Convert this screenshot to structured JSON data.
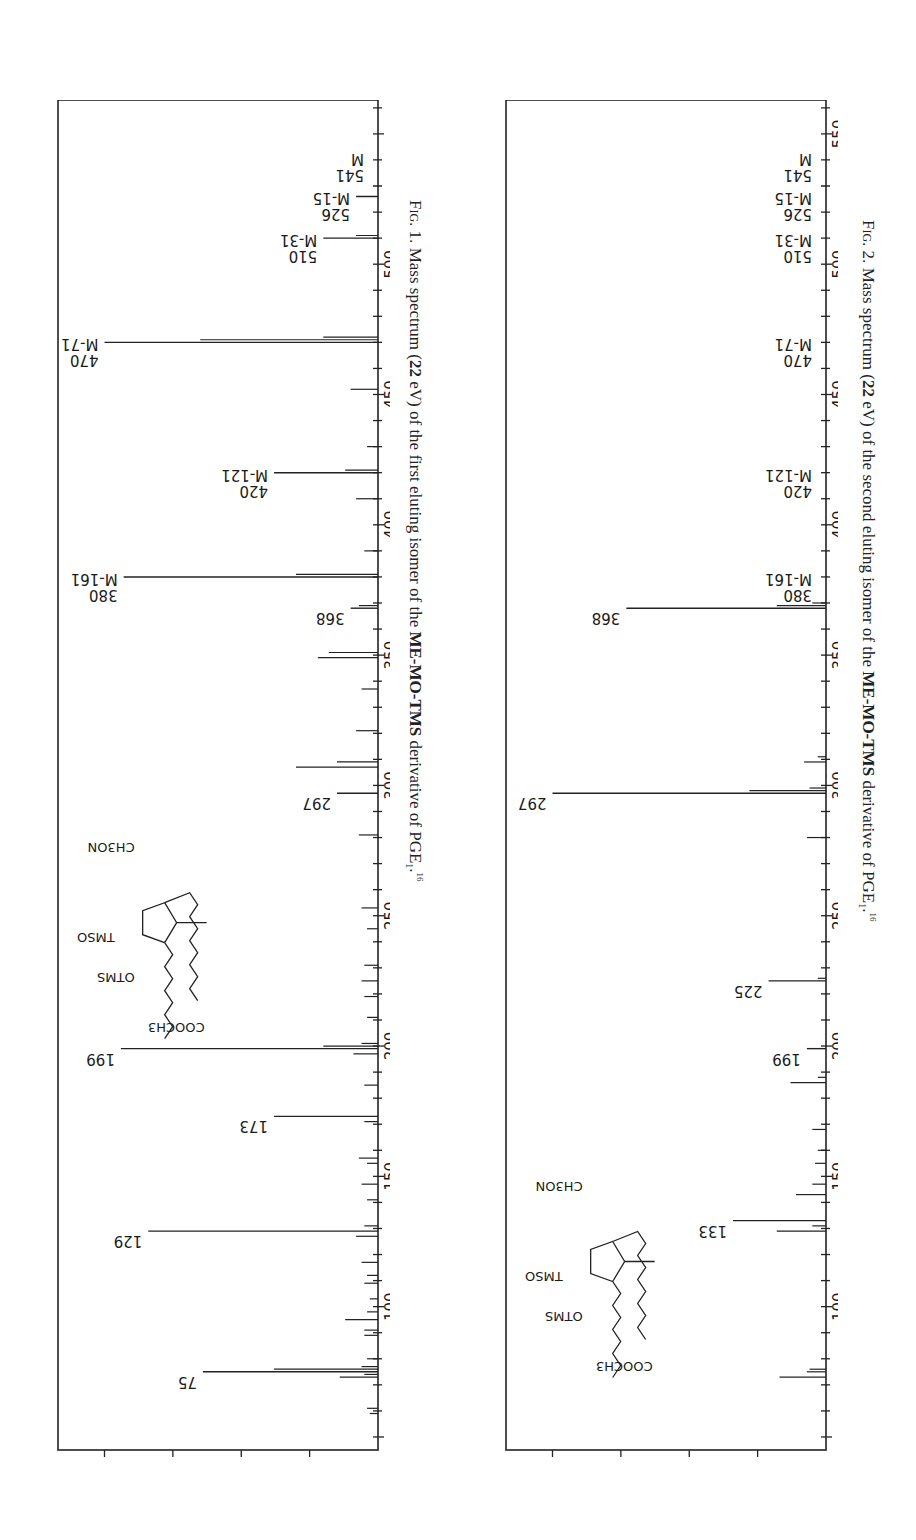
{
  "figures": [
    {
      "id": "fig1",
      "caption": {
        "fig_label": "Fig. 1.",
        "text_before": "Mass spectrum (",
        "energy": "22",
        "text_mid": " eV) of the first eluting isomer of the ",
        "derivative": "ME-MO-TMS",
        "text_after": " derivative of PGE",
        "subscript": "1",
        "period": ".",
        "ref": "16"
      }
    },
    {
      "id": "fig2",
      "caption": {
        "fig_label": "Fig. 2.",
        "text_before": "Mass spectrum (",
        "energy": "22",
        "text_mid": " eV) of the second eluting isomer of the ",
        "derivative": "ME-MO-TMS",
        "text_after": " derivative of PGE",
        "subscript": "1",
        "period": ".",
        "ref": "16"
      }
    }
  ],
  "structure_labels": {
    "top_chain": "COOCH3",
    "oxime": "CH3ON",
    "tmso": "TMSO",
    "otms": "OTMS",
    "h": "H"
  },
  "chart_data": [
    {
      "type": "bar",
      "title": "Fig. 1. Mass spectrum (22 eV) of the first eluting isomer of the ME-MO-TMS derivative of PGE1",
      "xlabel": "m/e",
      "ylabel": "RELATIVE INTENSITY",
      "xlim": [
        45,
        563
      ],
      "ylim": [
        0,
        117
      ],
      "x_ticks": [
        100,
        150,
        200,
        250,
        300,
        350,
        400,
        450,
        500
      ],
      "y_ticks": [
        25,
        50,
        75,
        100
      ],
      "secondary_axis": {
        "label": "Σ%",
        "ticks": [
          "8.4",
          "4"
        ]
      },
      "grid": false,
      "orientation": "rotated 90deg clockwise",
      "labeled_peaks": [
        {
          "mz": 75,
          "label": "75",
          "intensity": 64
        },
        {
          "mz": 129,
          "label": "129",
          "intensity": 84
        },
        {
          "mz": 173,
          "label": "173",
          "intensity": 38
        },
        {
          "mz": 199,
          "label": "199",
          "intensity": 94
        },
        {
          "mz": 297,
          "label": "297",
          "intensity": 15
        },
        {
          "mz": 368,
          "label": "368",
          "intensity": 10
        },
        {
          "mz": 380,
          "label": "M-161\n380",
          "intensity": 93
        },
        {
          "mz": 420,
          "label": "M-121\n420",
          "intensity": 38
        },
        {
          "mz": 470,
          "label": "M-71\n470",
          "intensity": 100
        },
        {
          "mz": 510,
          "label": "M-31\n510",
          "intensity": 20
        },
        {
          "mz": 526,
          "label": "M-15\n526",
          "intensity": 8
        },
        {
          "mz": 541,
          "label": "M\n541",
          "intensity": 0
        }
      ],
      "minor_peaks": [
        {
          "mz": 59,
          "intensity": 3
        },
        {
          "mz": 61,
          "intensity": 4
        },
        {
          "mz": 73,
          "intensity": 14
        },
        {
          "mz": 74,
          "intensity": 5
        },
        {
          "mz": 76,
          "intensity": 38
        },
        {
          "mz": 77,
          "intensity": 6
        },
        {
          "mz": 80,
          "intensity": 4
        },
        {
          "mz": 89,
          "intensity": 5
        },
        {
          "mz": 91,
          "intensity": 5
        },
        {
          "mz": 95,
          "intensity": 12
        },
        {
          "mz": 98,
          "intensity": 4
        },
        {
          "mz": 103,
          "intensity": 3
        },
        {
          "mz": 109,
          "intensity": 5
        },
        {
          "mz": 112,
          "intensity": 4
        },
        {
          "mz": 117,
          "intensity": 6
        },
        {
          "mz": 127,
          "intensity": 8
        },
        {
          "mz": 131,
          "intensity": 5
        },
        {
          "mz": 141,
          "intensity": 4
        },
        {
          "mz": 147,
          "intensity": 6
        },
        {
          "mz": 155,
          "intensity": 4
        },
        {
          "mz": 157,
          "intensity": 7
        },
        {
          "mz": 171,
          "intensity": 5
        },
        {
          "mz": 185,
          "intensity": 5
        },
        {
          "mz": 197,
          "intensity": 9
        },
        {
          "mz": 200,
          "intensity": 20
        },
        {
          "mz": 201,
          "intensity": 6
        },
        {
          "mz": 211,
          "intensity": 4
        },
        {
          "mz": 219,
          "intensity": 5
        },
        {
          "mz": 225,
          "intensity": 6
        },
        {
          "mz": 231,
          "intensity": 5
        },
        {
          "mz": 245,
          "intensity": 4
        },
        {
          "mz": 253,
          "intensity": 6
        },
        {
          "mz": 281,
          "intensity": 7
        },
        {
          "mz": 307,
          "intensity": 30
        },
        {
          "mz": 309,
          "intensity": 15
        },
        {
          "mz": 321,
          "intensity": 8
        },
        {
          "mz": 337,
          "intensity": 6
        },
        {
          "mz": 349,
          "intensity": 22
        },
        {
          "mz": 351,
          "intensity": 18
        },
        {
          "mz": 369,
          "intensity": 7
        },
        {
          "mz": 381,
          "intensity": 30
        },
        {
          "mz": 390,
          "intensity": 5
        },
        {
          "mz": 410,
          "intensity": 8
        },
        {
          "mz": 421,
          "intensity": 12
        },
        {
          "mz": 430,
          "intensity": 4
        },
        {
          "mz": 452,
          "intensity": 10
        },
        {
          "mz": 471,
          "intensity": 65
        },
        {
          "mz": 472,
          "intensity": 20
        },
        {
          "mz": 511,
          "intensity": 8
        }
      ]
    },
    {
      "type": "bar",
      "title": "Fig. 2. Mass spectrum (22 eV) of the second eluting isomer of the ME-MO-TMS derivative of PGE1",
      "xlabel": "m/e",
      "ylabel": "RELATIVE INTENSITY",
      "xlim": [
        45,
        563
      ],
      "ylim": [
        0,
        117
      ],
      "x_ticks": [
        100,
        150,
        200,
        250,
        300,
        350,
        400,
        450,
        500,
        550
      ],
      "y_ticks": [
        25,
        50,
        75,
        100
      ],
      "secondary_axis": {
        "label": "Σ%",
        "ticks": [
          "21.8",
          "11"
        ]
      },
      "grid": false,
      "orientation": "rotated 90deg clockwise",
      "labeled_peaks": [
        {
          "mz": 133,
          "label": "133",
          "intensity": 34
        },
        {
          "mz": 199,
          "label": "199",
          "intensity": 7
        },
        {
          "mz": 225,
          "label": "225",
          "intensity": 21
        },
        {
          "mz": 297,
          "label": "297",
          "intensity": 100
        },
        {
          "mz": 368,
          "label": "368",
          "intensity": 73
        },
        {
          "mz": 380,
          "label": "M-161\n380",
          "intensity": 0
        },
        {
          "mz": 420,
          "label": "M-121\n420",
          "intensity": 0
        },
        {
          "mz": 470,
          "label": "M-71\n470",
          "intensity": 0
        },
        {
          "mz": 510,
          "label": "M-31\n510",
          "intensity": 0
        },
        {
          "mz": 526,
          "label": "M-15\n526",
          "intensity": 0
        },
        {
          "mz": 541,
          "label": "M\n541",
          "intensity": 0
        }
      ],
      "minor_peaks": [
        {
          "mz": 73,
          "intensity": 17
        },
        {
          "mz": 75,
          "intensity": 7
        },
        {
          "mz": 76,
          "intensity": 6
        },
        {
          "mz": 129,
          "intensity": 18
        },
        {
          "mz": 131,
          "intensity": 5
        },
        {
          "mz": 143,
          "intensity": 11
        },
        {
          "mz": 147,
          "intensity": 5
        },
        {
          "mz": 155,
          "intensity": 4
        },
        {
          "mz": 160,
          "intensity": 3
        },
        {
          "mz": 168,
          "intensity": 5
        },
        {
          "mz": 186,
          "intensity": 13
        },
        {
          "mz": 188,
          "intensity": 3
        },
        {
          "mz": 226,
          "intensity": 3
        },
        {
          "mz": 280,
          "intensity": 7
        },
        {
          "mz": 298,
          "intensity": 28
        },
        {
          "mz": 299,
          "intensity": 6
        },
        {
          "mz": 309,
          "intensity": 8
        },
        {
          "mz": 311,
          "intensity": 3
        },
        {
          "mz": 369,
          "intensity": 18
        },
        {
          "mz": 370,
          "intensity": 5
        }
      ]
    }
  ]
}
